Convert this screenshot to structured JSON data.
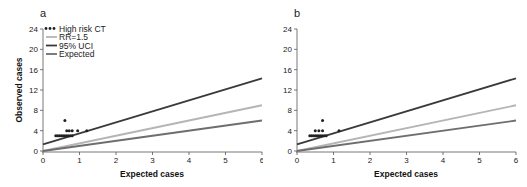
{
  "chart_data": [
    {
      "panel": "a",
      "type": "scatter",
      "xlabel": "Expected cases",
      "ylabel": "Observed cases",
      "xlim": [
        0,
        6
      ],
      "ylim": [
        0,
        24
      ],
      "xticks": [
        "0",
        "1",
        "2",
        "3",
        "4",
        "5",
        "6"
      ],
      "yticks": [
        "0",
        "4",
        "8",
        "12",
        "16",
        "20",
        "24"
      ],
      "grid": false,
      "legend_position": "top-left",
      "legend": [
        "High risk CT",
        "RR=1.5",
        "95% UCI",
        "Expected"
      ],
      "series": [
        {
          "name": "High risk CT",
          "kind": "points",
          "color": "#222222",
          "points": [
            [
              0.35,
              3
            ],
            [
              0.4,
              3
            ],
            [
              0.45,
              3
            ],
            [
              0.5,
              3
            ],
            [
              0.55,
              3
            ],
            [
              0.6,
              3
            ],
            [
              0.65,
              3
            ],
            [
              0.7,
              3
            ],
            [
              0.75,
              3
            ],
            [
              0.8,
              3
            ],
            [
              0.6,
              6
            ],
            [
              0.65,
              4
            ],
            [
              0.72,
              4
            ],
            [
              0.8,
              4
            ],
            [
              0.95,
              4
            ],
            [
              1.2,
              4
            ]
          ]
        },
        {
          "name": "RR=1.5",
          "kind": "line",
          "color": "#b5b5b5",
          "x": [
            0,
            6
          ],
          "y": [
            0,
            9
          ]
        },
        {
          "name": "95% UCI",
          "kind": "line",
          "color": "#3a3a3a",
          "x": [
            0,
            6
          ],
          "y": [
            1.3,
            14.3
          ]
        },
        {
          "name": "Expected",
          "kind": "line",
          "color": "#6e6e6e",
          "x": [
            0,
            6
          ],
          "y": [
            0,
            6
          ]
        }
      ]
    },
    {
      "panel": "b",
      "type": "scatter",
      "xlabel": "Expected cases",
      "ylabel": "",
      "xlim": [
        0,
        6
      ],
      "ylim": [
        0,
        24
      ],
      "xticks": [
        "0",
        "1",
        "2",
        "3",
        "4",
        "5",
        "6"
      ],
      "yticks": [
        "0",
        "4",
        "8",
        "12",
        "16",
        "20",
        "24"
      ],
      "grid": false,
      "series": [
        {
          "name": "High risk CT",
          "kind": "points",
          "color": "#222222",
          "points": [
            [
              0.35,
              3
            ],
            [
              0.4,
              3
            ],
            [
              0.45,
              3
            ],
            [
              0.5,
              3
            ],
            [
              0.55,
              3
            ],
            [
              0.6,
              3
            ],
            [
              0.65,
              3
            ],
            [
              0.7,
              3
            ],
            [
              0.75,
              3
            ],
            [
              0.8,
              3
            ],
            [
              0.5,
              4
            ],
            [
              0.6,
              4
            ],
            [
              0.7,
              4
            ],
            [
              0.7,
              6
            ],
            [
              1.15,
              4
            ]
          ]
        },
        {
          "name": "RR=1.5",
          "kind": "line",
          "color": "#b5b5b5",
          "x": [
            0,
            6
          ],
          "y": [
            0,
            9
          ]
        },
        {
          "name": "95% UCI",
          "kind": "line",
          "color": "#3a3a3a",
          "x": [
            0,
            6
          ],
          "y": [
            1.3,
            14.3
          ]
        },
        {
          "name": "Expected",
          "kind": "line",
          "color": "#6e6e6e",
          "x": [
            0,
            6
          ],
          "y": [
            0,
            6
          ]
        }
      ]
    }
  ],
  "panels": {
    "a": {
      "letter": "a",
      "xlabel": "Expected cases",
      "ylabel": "Observed cases"
    },
    "b": {
      "letter": "b",
      "xlabel": "Expected cases"
    }
  },
  "legend": {
    "items": [
      {
        "label": "High risk CT",
        "marker": "dots",
        "color": "#222222"
      },
      {
        "label": "RR=1.5",
        "marker": "line",
        "color": "#b5b5b5"
      },
      {
        "label": "95% UCI",
        "marker": "line",
        "color": "#3a3a3a"
      },
      {
        "label": "Expected",
        "marker": "line",
        "color": "#6e6e6e"
      }
    ]
  }
}
